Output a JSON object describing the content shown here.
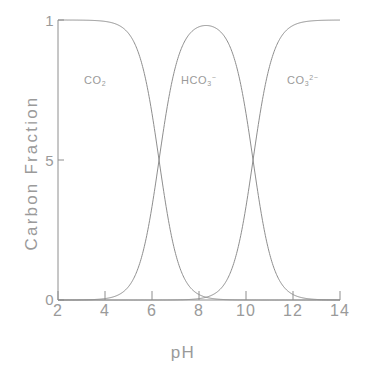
{
  "chart_data": {
    "type": "line",
    "title": "",
    "xlabel": "pH",
    "ylabel": "Carbon Fraction",
    "xlim": [
      2,
      14
    ],
    "ylim": [
      0,
      1
    ],
    "grid": false,
    "legend_position": "inline-annotations",
    "xticks": [
      "2",
      "4",
      "6",
      "8",
      "10",
      "12",
      "14"
    ],
    "xtick_values": [
      2,
      4,
      6,
      8,
      10,
      12,
      14
    ],
    "yticks": [
      "1",
      "5",
      "0"
    ],
    "ytick_values": [
      1,
      0.5,
      0
    ],
    "annotations": [
      {
        "text": "CO2",
        "base": "CO",
        "sub": "2",
        "sup": "",
        "x": 4.3,
        "y": 0.78
      },
      {
        "text": "HCO3-",
        "base": "HCO",
        "sub": "3",
        "sup": "-",
        "x": 8.1,
        "y": 0.78
      },
      {
        "text": "CO3 2-",
        "base": "CO",
        "sub": "3",
        "sup": "2-",
        "x": 11.9,
        "y": 0.78
      }
    ],
    "parameters": {
      "pKa1": 6.3,
      "pKa2": 10.3
    },
    "series": [
      {
        "name": "CO2",
        "x": [
          2.0,
          2.5,
          3.0,
          3.5,
          4.0,
          4.5,
          5.0,
          5.3,
          5.6,
          5.9,
          6.0,
          6.3,
          6.6,
          6.9,
          7.2,
          7.5,
          8.0,
          8.5,
          9.0,
          9.5,
          10.0,
          10.5,
          11.0,
          12.0,
          13.0,
          14.0
        ],
        "values": [
          1.0,
          1.0,
          0.999,
          0.998,
          0.995,
          0.984,
          0.952,
          0.909,
          0.834,
          0.715,
          0.666,
          0.5,
          0.334,
          0.2,
          0.112,
          0.059,
          0.02,
          0.0063,
          0.002,
          0.00063,
          0.0002,
          6e-05,
          2e-05,
          0.0,
          0.0,
          0.0
        ]
      },
      {
        "name": "HCO3-",
        "x": [
          2.0,
          2.5,
          3.0,
          3.5,
          4.0,
          4.5,
          5.0,
          5.3,
          5.6,
          5.9,
          6.0,
          6.3,
          6.6,
          6.9,
          7.2,
          7.5,
          8.0,
          8.3,
          8.5,
          9.0,
          9.5,
          10.0,
          10.3,
          10.6,
          11.0,
          11.5,
          12.0,
          12.5,
          13.0,
          13.5,
          14.0
        ],
        "values": [
          0.0,
          0.0,
          0.001,
          0.002,
          0.005,
          0.016,
          0.048,
          0.091,
          0.166,
          0.285,
          0.334,
          0.5,
          0.666,
          0.8,
          0.888,
          0.941,
          0.979,
          0.985,
          0.987,
          0.989,
          0.985,
          0.966,
          0.5,
          0.333,
          0.159,
          0.059,
          0.02,
          0.0063,
          0.002,
          0.00063,
          0.0002
        ]
      },
      {
        "name": "CO3 2-",
        "x": [
          2.0,
          4.0,
          6.0,
          7.0,
          8.0,
          8.5,
          9.0,
          9.5,
          10.0,
          10.3,
          10.6,
          11.0,
          11.5,
          12.0,
          12.5,
          13.0,
          13.5,
          14.0
        ],
        "values": [
          0.0,
          0.0,
          0.0,
          0.0,
          0.001,
          0.002,
          0.005,
          0.015,
          0.047,
          0.1,
          0.2,
          0.333,
          0.613,
          0.834,
          0.941,
          0.98,
          0.994,
          0.998
        ]
      }
    ]
  },
  "axis": {
    "ylabel": "Carbon Fraction",
    "xlabel": "pH"
  },
  "labels": {
    "co2": {
      "base": "CO",
      "sub": "2",
      "sup": ""
    },
    "hco3": {
      "base": "HCO",
      "sub": "3",
      "sup": "−"
    },
    "co3": {
      "base": "CO",
      "sub": "3",
      "sup": "2−"
    }
  },
  "ticks": {
    "x": [
      "2",
      "4",
      "6",
      "8",
      "10",
      "12",
      "14"
    ],
    "y": [
      "1",
      "5",
      "0"
    ]
  },
  "colors": {
    "curve": "#8e8e8e",
    "axis": "#8e8e8e",
    "text": "#9a9a9a",
    "background": "#ffffff"
  }
}
